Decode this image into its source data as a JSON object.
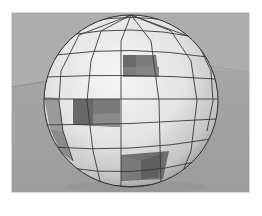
{
  "scene": {
    "subject": "faceted sphere with missing panels",
    "background": "grey floor plane with horizon",
    "colors": {
      "page_bg": "#ffffff",
      "viewport_border": "#d8d8d8",
      "sky": "#acacac",
      "floor": "#a2a2a2",
      "panel_light": "#efefef",
      "panel_mid": "#d9d9d9",
      "panel_shade": "#bdbdbd",
      "interior_dark": "#7a7a7a",
      "interior_darker": "#5f5f5f",
      "edge": "#3a3a3a"
    },
    "missing_panels": [
      {
        "position": "upper-center"
      },
      {
        "position": "middle-left"
      },
      {
        "position": "lower-center"
      }
    ]
  }
}
